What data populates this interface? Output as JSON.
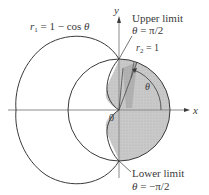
{
  "figure": {
    "type": "polar-area-diagram",
    "curves": [
      {
        "name": "cardioid",
        "equation": "r_1 = 1 − cos θ"
      },
      {
        "name": "unit-circle",
        "equation": "r_2 = 1"
      }
    ],
    "shaded_region": "inside r_2 = 1 and outside r_1 = 1 − cos θ, for −π/2 ≤ θ ≤ π/2",
    "colors": {
      "curve": "#3a3a3a",
      "axis": "#8a8a8a",
      "shade": "#c8c8c8",
      "strip": "#9a9a9a",
      "text": "#3a3a3a"
    }
  },
  "labels": {
    "r1_var": "r",
    "r1_sub": "1",
    "r1_rhs": " = 1 − cos ",
    "r1_theta": "θ",
    "y_axis": "y",
    "x_axis": "x",
    "origin": "0",
    "upper_title": "Upper limit",
    "upper_theta": "θ",
    "upper_value": " = π/2",
    "r2_var": "r",
    "r2_sub": "2",
    "r2_rhs": " = 1",
    "theta_angle": "θ",
    "lower_title": "Lower limit",
    "lower_theta": "θ",
    "lower_value": " = −π/2"
  }
}
